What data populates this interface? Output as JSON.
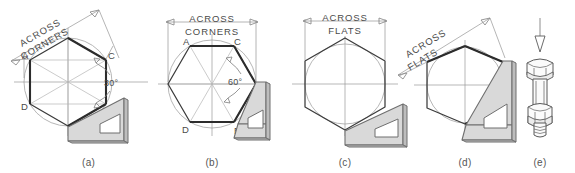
{
  "figure": {
    "background_color": "#ffffff",
    "line_color": "#3b3b3b",
    "construction_color": "#b4b4b4",
    "dimension_color": "#9c9c9c",
    "set_square_fill": "#d9d9d9"
  },
  "panels": [
    {
      "id": "a",
      "caption": "(a)",
      "dimension_label_line1": "ACROSS",
      "dimension_label_line2": "CORNERS",
      "dimension_rotated": true,
      "angle_label": "30°",
      "vertex_labels": [
        "A",
        "C",
        "D",
        "B"
      ],
      "hexagon_orientation": "tilted",
      "has_set_square": true,
      "has_circle": true
    },
    {
      "id": "b",
      "caption": "(b)",
      "dimension_label_line1": "ACROSS",
      "dimension_label_line2": "CORNERS",
      "dimension_rotated": false,
      "angle_label": "60°",
      "vertex_labels": [
        "A",
        "C",
        "D",
        "B"
      ],
      "hexagon_orientation": "flat-top",
      "has_set_square": true,
      "has_circle": true
    },
    {
      "id": "c",
      "caption": "(c)",
      "dimension_label_line1": "ACROSS",
      "dimension_label_line2": "FLATS",
      "dimension_rotated": false,
      "angle_label": "",
      "vertex_labels": [],
      "hexagon_orientation": "point-top",
      "has_set_square": true,
      "has_circle": true
    },
    {
      "id": "d",
      "caption": "(d)",
      "dimension_label_line1": "ACROSS",
      "dimension_label_line2": "FLATS",
      "dimension_rotated": true,
      "angle_label": "",
      "vertex_labels": [],
      "hexagon_orientation": "tilted",
      "has_set_square": true,
      "has_circle": true
    },
    {
      "id": "e",
      "caption": "(e)",
      "dimension_label_line1": "",
      "dimension_label_line2": "",
      "angle_label": "",
      "vertex_labels": [],
      "object": "hex-bolt-and-nut",
      "has_view_arrow": true
    }
  ],
  "labels": {
    "a_vertex_A": "A",
    "a_vertex_C": "C",
    "a_vertex_D": "D",
    "a_vertex_B": "B",
    "a_angle": "30°",
    "a_dim_1": "ACROSS",
    "a_dim_2": "CORNERS",
    "a_caption": "(a)",
    "b_vertex_A": "A",
    "b_vertex_C": "C",
    "b_vertex_D": "D",
    "b_vertex_B": "B",
    "b_angle": "60°",
    "b_dim_1": "ACROSS",
    "b_dim_2": "CORNERS",
    "b_caption": "(b)",
    "c_dim_1": "ACROSS",
    "c_dim_2": "FLATS",
    "c_caption": "(c)",
    "d_dim_1": "ACROSS",
    "d_dim_2": "FLATS",
    "d_caption": "(d)",
    "e_caption": "(e)"
  }
}
